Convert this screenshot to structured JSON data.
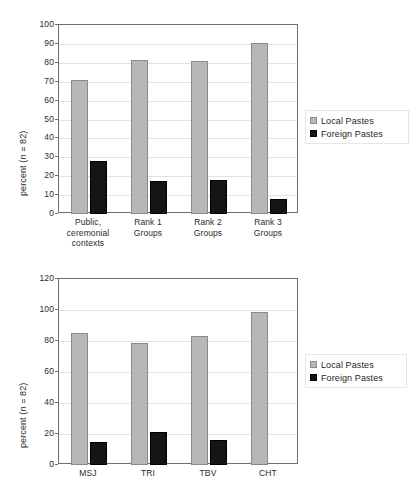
{
  "figure": {
    "title": "",
    "background": "#ffffff"
  },
  "colors": {
    "local": "#b7b7b7",
    "foreign": "#151515",
    "axis": "#6e6e6e",
    "grid": "#e2e2e2",
    "text": "#2a2a2a"
  },
  "charts": [
    {
      "id": "chart-contexts",
      "ylabel_prefix": "percent (",
      "ylabel_italic": "n",
      "ylabel_suffix": " = 82)",
      "legend": [
        {
          "label": "Local Pastes",
          "swatch": "local"
        },
        {
          "label": "Foreign Pastes",
          "swatch": "foreign"
        }
      ]
    },
    {
      "id": "chart-sites",
      "ylabel_prefix": "percent (",
      "ylabel_italic": "n",
      "ylabel_suffix": " = 82)",
      "legend": [
        {
          "label": "Local Pastes",
          "swatch": "local"
        },
        {
          "label": "Foreign Pastes",
          "swatch": "foreign"
        }
      ]
    }
  ],
  "chart_data": [
    {
      "type": "bar",
      "id": "chart-contexts",
      "title": "",
      "xlabel": "",
      "ylabel": "percent (n = 82)",
      "ylim": [
        0,
        100
      ],
      "yticks": [
        0,
        10,
        20,
        30,
        40,
        50,
        60,
        70,
        80,
        90,
        100
      ],
      "grid": true,
      "legend_position": "right",
      "categories": [
        "Public, ceremonial contexts",
        "Rank 1 Groups",
        "Rank 2 Groups",
        "Rank 3 Groups"
      ],
      "category_lines": [
        [
          "Public,",
          "ceremonial",
          "contexts"
        ],
        [
          "Rank 1",
          "Groups"
        ],
        [
          "Rank 2",
          "Groups"
        ],
        [
          "Rank 3",
          "Groups"
        ]
      ],
      "series": [
        {
          "name": "Local Pastes",
          "color": "#b7b7b7",
          "values": [
            71,
            81.5,
            81,
            90.5
          ]
        },
        {
          "name": "Foreign Pastes",
          "color": "#151515",
          "values": [
            28,
            17.5,
            18,
            8
          ]
        }
      ]
    },
    {
      "type": "bar",
      "id": "chart-sites",
      "title": "",
      "xlabel": "",
      "ylabel": "percent (n = 82)",
      "ylim": [
        0,
        120
      ],
      "yticks": [
        0,
        20,
        40,
        60,
        80,
        100,
        120
      ],
      "grid": true,
      "legend_position": "right",
      "categories": [
        "MSJ",
        "TRI",
        "TBV",
        "CHT"
      ],
      "category_lines": [
        [
          "MSJ"
        ],
        [
          "TRI"
        ],
        [
          "TBV"
        ],
        [
          "CHT"
        ]
      ],
      "series": [
        {
          "name": "Local Pastes",
          "color": "#b7b7b7",
          "values": [
            85,
            78.5,
            83,
            99
          ]
        },
        {
          "name": "Foreign Pastes",
          "color": "#151515",
          "values": [
            15,
            21,
            16,
            0
          ]
        }
      ]
    }
  ]
}
